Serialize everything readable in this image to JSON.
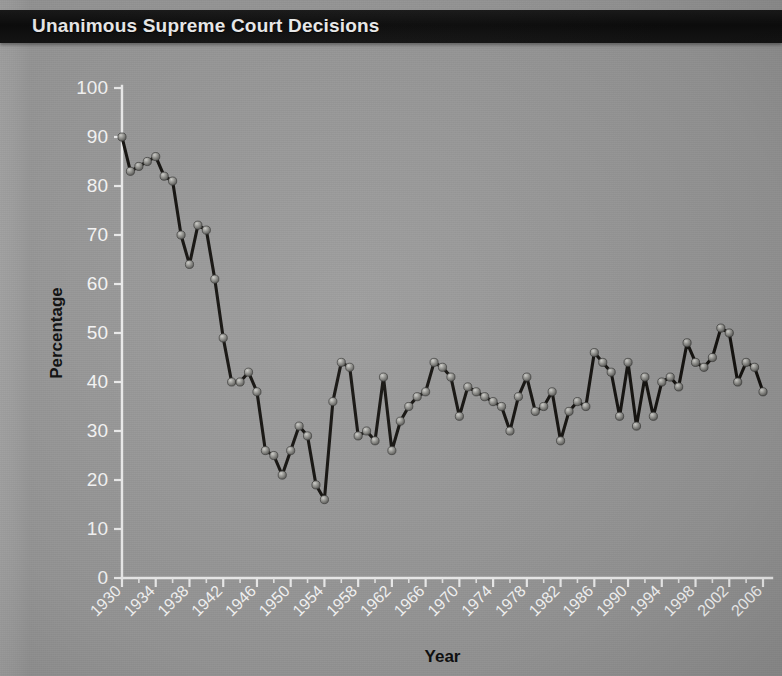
{
  "title": "Unanimous Supreme Court Decisions",
  "colors": {
    "titlebar_bg": "#0d0d0d",
    "title_text": "#f2f2f2",
    "page_bg": "#9a9a9a",
    "axis": "#f0f0f0",
    "tick_label": "#fbfbfb",
    "axis_title": "#101010",
    "line": "#14120f",
    "marker": "#8d8d8a"
  },
  "axes": {
    "y": {
      "label": "Percentage",
      "min": 0,
      "max": 100,
      "tick_step": 10,
      "ticks": [
        "0",
        "10",
        "20",
        "30",
        "40",
        "50",
        "60",
        "70",
        "80",
        "90",
        "100"
      ]
    },
    "x": {
      "label": "Year",
      "min": 1930,
      "max": 2006,
      "tick_step": 4,
      "minor_tick_step": 2,
      "ticks": [
        "1930",
        "1934",
        "1938",
        "1942",
        "1946",
        "1950",
        "1954",
        "1958",
        "1962",
        "1966",
        "1970",
        "1974",
        "1978",
        "1982",
        "1986",
        "1990",
        "1994",
        "1998",
        "2002",
        "2006"
      ]
    }
  },
  "chart_data": {
    "type": "line",
    "title": "Unanimous Supreme Court Decisions",
    "xlabel": "Year",
    "ylabel": "Percentage",
    "xlim": [
      1930,
      2006
    ],
    "ylim": [
      0,
      100
    ],
    "grid": false,
    "legend": null,
    "markers": true,
    "x": [
      1930,
      1931,
      1932,
      1933,
      1934,
      1935,
      1936,
      1937,
      1938,
      1939,
      1940,
      1941,
      1942,
      1943,
      1944,
      1945,
      1946,
      1947,
      1948,
      1949,
      1950,
      1951,
      1952,
      1953,
      1954,
      1955,
      1956,
      1957,
      1958,
      1959,
      1960,
      1961,
      1962,
      1963,
      1964,
      1965,
      1966,
      1967,
      1968,
      1969,
      1970,
      1971,
      1972,
      1973,
      1974,
      1975,
      1976,
      1977,
      1978,
      1979,
      1980,
      1981,
      1982,
      1983,
      1984,
      1985,
      1986,
      1987,
      1988,
      1989,
      1990,
      1991,
      1992,
      1993,
      1994,
      1995,
      1996,
      1997,
      1998,
      1999,
      2000,
      2001,
      2002,
      2003,
      2004,
      2005,
      2006
    ],
    "y": [
      90,
      83,
      84,
      85,
      86,
      82,
      81,
      70,
      64,
      72,
      71,
      61,
      49,
      40,
      40,
      42,
      38,
      26,
      25,
      21,
      26,
      31,
      29,
      19,
      16,
      36,
      44,
      43,
      29,
      30,
      28,
      41,
      26,
      32,
      35,
      37,
      38,
      44,
      43,
      41,
      33,
      39,
      38,
      37,
      36,
      35,
      30,
      37,
      41,
      34,
      35,
      38,
      28,
      34,
      36,
      35,
      46,
      44,
      42,
      33,
      44,
      31,
      41,
      33,
      40,
      41,
      39,
      48,
      44,
      43,
      45,
      51,
      50,
      40,
      44,
      43,
      38
    ],
    "series_name": "Unanimous decisions (%)"
  }
}
